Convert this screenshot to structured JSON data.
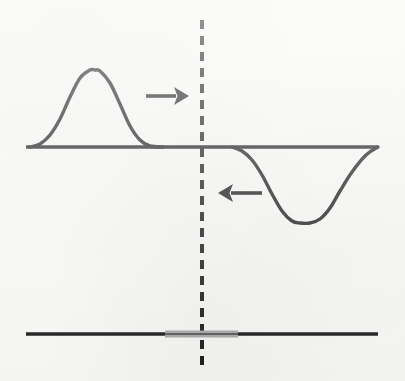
{
  "figure": {
    "background_color": "#f7f7f5",
    "ink_color": "#1a1a1a",
    "accent_color": "#a8a8a8",
    "width": 405,
    "height": 381
  },
  "chart_data": {
    "type": "line",
    "xlabel": "",
    "ylabel": "",
    "xlim": [
      0,
      405
    ],
    "ylim": [
      381,
      0
    ],
    "grid": false,
    "legend": null,
    "series": [
      {
        "name": "incident-pulse",
        "description": "Upward gaussian pulse travelling to the right",
        "baseline_y": 147,
        "peak": {
          "x": 95,
          "y": 70
        },
        "amplitude": 77,
        "x_start": 30,
        "x_end": 163,
        "x": [
          30,
          40,
          50,
          60,
          70,
          80,
          90,
          95,
          100,
          110,
          120,
          130,
          140,
          150,
          163
        ],
        "y": [
          147,
          144,
          135,
          119,
          97,
          78,
          70,
          70,
          71,
          83,
          104,
          126,
          140,
          146,
          147
        ]
      },
      {
        "name": "reflected-pulse",
        "description": "Inverted gaussian pulse travelling to the left",
        "baseline_y": 147,
        "trough": {
          "x": 305,
          "y": 223
        },
        "amplitude": -76,
        "x_start": 232,
        "x_end": 378,
        "x": [
          232,
          242,
          252,
          262,
          272,
          282,
          292,
          300,
          310,
          320,
          330,
          340,
          352,
          366,
          378
        ],
        "y": [
          147,
          151,
          160,
          175,
          194,
          211,
          221,
          223,
          223,
          219,
          208,
          191,
          172,
          155,
          147
        ]
      }
    ],
    "axes": [
      {
        "name": "upper-baseline",
        "orientation": "horizontal",
        "y": 147,
        "x_start": 26,
        "x_end": 378,
        "color": "#1a1a1a",
        "thickness": 3.5
      },
      {
        "name": "lower-medium-line",
        "orientation": "horizontal",
        "y": 334,
        "x_start": 26,
        "x_end": 378,
        "color": "#1a1a1a",
        "thickness": 3.5
      }
    ],
    "annotations": [
      {
        "name": "boundary-line",
        "kind": "dashed-vertical-line",
        "x": 202,
        "y_start": 20,
        "y_end": 370,
        "dash": 9,
        "gap": 7,
        "thickness": 4,
        "color": "#1a1a1a",
        "label": ""
      },
      {
        "name": "incident-direction-arrow",
        "kind": "arrow",
        "direction": "right",
        "x_start": 146,
        "x_end": 189,
        "y": 96,
        "color": "#1a1a1a",
        "label": ""
      },
      {
        "name": "reflected-direction-arrow",
        "kind": "arrow",
        "direction": "left",
        "x_start": 262,
        "x_end": 218,
        "y": 193,
        "color": "#1a1a1a",
        "label": ""
      },
      {
        "name": "boundary-segment-highlight",
        "kind": "thick-segment",
        "x_start": 165,
        "x_end": 238,
        "y": 334,
        "thickness": 7,
        "color": "#a8a8a8",
        "label": ""
      }
    ]
  }
}
